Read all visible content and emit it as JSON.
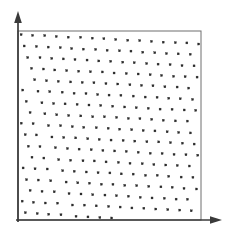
{
  "figure": {
    "title": "",
    "background_color": "#ffffff",
    "width": 226,
    "height": 232
  },
  "axes": {
    "y_axis": {
      "label": "",
      "name": "y-axis",
      "x": 18,
      "y_top": 12,
      "y_bottom": 222,
      "arrow": "up",
      "color": "#3a3a3a",
      "line_width": 1.6
    },
    "x_axis": {
      "label": "",
      "name": "x-axis",
      "y": 220,
      "x_left": 16,
      "x_right": 222,
      "arrow": "right",
      "color": "#3a3a3a",
      "line_width": 1.6
    }
  },
  "plot_frame": {
    "left": 18,
    "top": 31,
    "right": 201,
    "bottom": 220,
    "stroke_color": "#6e6e6e",
    "stroke_width": 1.0,
    "fill": "none"
  },
  "chart_data": {
    "type": "scatter",
    "title": "",
    "subtitle": "",
    "xlabel": "",
    "ylabel": "",
    "xlim": [
      18,
      201
    ],
    "ylim": [
      31,
      220
    ],
    "grid": false,
    "legend": null,
    "legend_position": "none",
    "annotations": [],
    "tick_labels_x": [],
    "tick_labels_y": [],
    "marker": {
      "shape": "square",
      "size_px": 2.0,
      "color": "#2b2b2b",
      "edge_color": "#2b2b2b"
    },
    "lattice": {
      "origin_x": 21.0,
      "origin_y": 34.5,
      "vector_a": [
        11.85,
        0.62
      ],
      "vector_b": [
        3.45,
        11.35
      ],
      "rotation_deg": 3.0,
      "columns": 17,
      "rows": 18,
      "jitter_px": 0.35,
      "point_count": 306
    }
  }
}
